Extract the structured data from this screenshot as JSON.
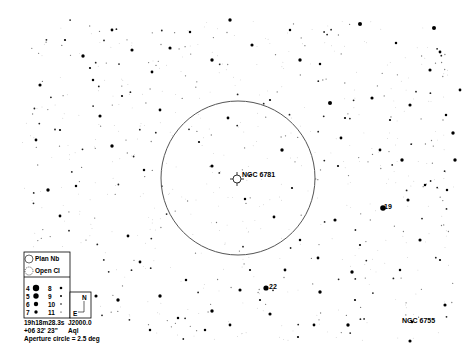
{
  "chart": {
    "type": "star-chart",
    "background": "#ffffff",
    "ink": "#000000",
    "aperture_circle": {
      "cx": 238,
      "cy": 178,
      "r": 77,
      "stroke": "#555555"
    },
    "target": {
      "name": "NGC 6781",
      "type": "Planetary Nebula",
      "x": 237,
      "y": 179,
      "label_x": 242,
      "label_y": 177
    }
  },
  "labels": [
    {
      "text": "NGC 6781",
      "x": 242,
      "y": 177,
      "name": "target-label"
    },
    {
      "text": "19",
      "x": 384,
      "y": 209,
      "name": "star-label-19"
    },
    {
      "text": "22",
      "x": 269,
      "y": 289,
      "name": "star-label-22"
    },
    {
      "text": "NGC 6755",
      "x": 402,
      "y": 323,
      "name": "ngc6755-label"
    }
  ],
  "legend": {
    "objects": [
      {
        "symbol": "planetary-nebula",
        "label": "Plan Nb"
      },
      {
        "symbol": "open-cluster",
        "label": "Open Cl"
      }
    ],
    "magnitudes": [
      {
        "mag": "4",
        "r": 3.2
      },
      {
        "mag": "5",
        "r": 2.7
      },
      {
        "mag": "6",
        "r": 2.2
      },
      {
        "mag": "7",
        "r": 1.7
      },
      {
        "mag": "8",
        "r": 1.3
      },
      {
        "mag": "9",
        "r": 1.0
      },
      {
        "mag": "10",
        "r": 0.8
      },
      {
        "mag": "11",
        "r": 0.6
      }
    ],
    "compass": {
      "north": "N",
      "east": "E"
    }
  },
  "info": {
    "ra": "19h18m28.3s",
    "epoch": "J2000.0",
    "dec": "+06 32' 23\"",
    "constellation": "Aql",
    "aperture": "Aperture circle = 2.5 deg"
  },
  "bright_stars": [
    [
      383,
      208,
      2.8
    ],
    [
      266,
      288,
      2.6
    ],
    [
      83,
      56
    ],
    [
      93,
      80
    ],
    [
      132,
      50
    ],
    [
      90,
      68
    ],
    [
      152,
      72
    ],
    [
      360,
      24,
      2.0
    ],
    [
      396,
      43
    ],
    [
      430,
      70
    ],
    [
      434,
      28,
      2.0
    ],
    [
      440,
      52
    ],
    [
      330,
      103,
      2.0
    ],
    [
      446,
      115
    ],
    [
      372,
      98
    ],
    [
      345,
      118
    ],
    [
      341,
      138
    ],
    [
      453,
      133
    ],
    [
      447,
      190
    ],
    [
      445,
      305
    ],
    [
      260,
      300
    ],
    [
      230,
      325
    ],
    [
      212,
      311
    ],
    [
      205,
      330
    ],
    [
      270,
      314
    ],
    [
      298,
      337
    ],
    [
      314,
      325
    ],
    [
      348,
      325
    ],
    [
      412,
      322
    ],
    [
      410,
      341
    ],
    [
      292,
      188
    ],
    [
      274,
      217
    ],
    [
      282,
      150
    ],
    [
      245,
      199
    ],
    [
      212,
      166
    ],
    [
      199,
      142
    ],
    [
      128,
      236
    ],
    [
      160,
      296
    ],
    [
      178,
      318
    ],
    [
      38,
      270
    ],
    [
      32,
      300
    ],
    [
      60,
      216
    ],
    [
      48,
      190
    ],
    [
      76,
      186
    ],
    [
      100,
      116
    ],
    [
      122,
      96
    ],
    [
      160,
      110
    ],
    [
      300,
      60
    ],
    [
      320,
      64
    ],
    [
      252,
      45
    ],
    [
      270,
      100
    ],
    [
      228,
      118
    ],
    [
      212,
      60
    ],
    [
      190,
      32
    ],
    [
      170,
      48
    ],
    [
      338,
      166
    ],
    [
      318,
      258
    ],
    [
      352,
      272
    ],
    [
      400,
      270
    ],
    [
      420,
      240
    ],
    [
      440,
      260
    ],
    [
      380,
      150
    ],
    [
      402,
      160
    ],
    [
      425,
      185
    ],
    [
      408,
      200
    ],
    [
      60,
      130
    ],
    [
      36,
      140
    ],
    [
      112,
      146
    ],
    [
      144,
      170
    ],
    [
      40,
      85
    ],
    [
      65,
      40
    ],
    [
      112,
      30
    ],
    [
      230,
      20
    ],
    [
      290,
      30
    ],
    [
      410,
      105
    ],
    [
      390,
      120
    ],
    [
      460,
      90
    ],
    [
      455,
      160
    ],
    [
      300,
      240
    ],
    [
      335,
      220
    ],
    [
      360,
      245
    ],
    [
      140,
      262
    ],
    [
      118,
      300
    ],
    [
      150,
      330
    ],
    [
      96,
      296
    ],
    [
      250,
      270
    ],
    [
      285,
      270
    ],
    [
      320,
      292
    ],
    [
      186,
      280
    ],
    [
      240,
      290
    ],
    [
      355,
      300
    ]
  ],
  "faint_seed": 6781,
  "faint_count": 650
}
